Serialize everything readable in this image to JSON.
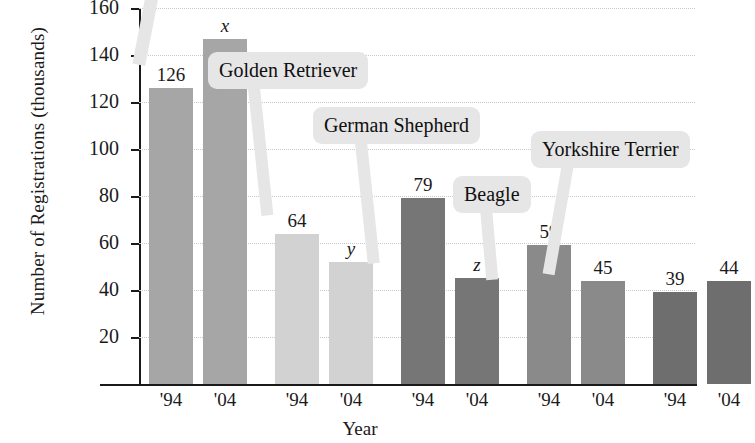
{
  "chart_data": {
    "type": "bar",
    "title": "",
    "xlabel": "Year",
    "ylabel": "Number of Registrations (thousands)",
    "ylim": [
      0,
      160
    ],
    "ytick_labels": [
      "20",
      "40",
      "60",
      "80",
      "100",
      "120",
      "140",
      "160"
    ],
    "ytick_values": [
      20,
      40,
      60,
      80,
      100,
      120,
      140,
      160
    ],
    "grid": true,
    "legend": "none",
    "categories": [
      "'94",
      "'04",
      "'94",
      "'04",
      "'94",
      "'04",
      "'94",
      "'04",
      "'94",
      "'04"
    ],
    "groups": [
      {
        "breed_label": "",
        "breed_label_visible": false,
        "color": "#a6a6a6",
        "bars": [
          {
            "year": "'94",
            "label": "126",
            "value": 126,
            "label_italic": false
          },
          {
            "year": "'04",
            "label": "x",
            "value": 147,
            "label_italic": true
          }
        ]
      },
      {
        "breed_label": "Golden Retriever",
        "breed_label_visible": true,
        "color": "#d2d2d2",
        "bars": [
          {
            "year": "'94",
            "label": "64",
            "value": 64,
            "label_italic": false
          },
          {
            "year": "'04",
            "label": "y",
            "value": 52,
            "label_italic": true
          }
        ]
      },
      {
        "breed_label": "German Shepherd",
        "breed_label_visible": true,
        "color": "#767676",
        "bars": [
          {
            "year": "'94",
            "label": "79",
            "value": 79,
            "label_italic": false
          },
          {
            "year": "'04",
            "label": "z",
            "value": 45,
            "label_italic": true
          }
        ]
      },
      {
        "breed_label": "Beagle",
        "breed_label_visible": true,
        "color": "#8a8a8a",
        "bars": [
          {
            "year": "'94",
            "label": "59",
            "value": 59,
            "label_italic": false
          },
          {
            "year": "'04",
            "label": "45",
            "value": 44,
            "label_italic": false
          }
        ]
      },
      {
        "breed_label": "Yorkshire Terrier",
        "breed_label_visible": true,
        "color": "#6e6e6e",
        "bars": [
          {
            "year": "'94",
            "label": "39",
            "value": 39,
            "label_italic": false
          },
          {
            "year": "'04",
            "label": "44",
            "value": 44,
            "label_italic": false
          }
        ]
      }
    ],
    "callouts": [
      {
        "text": "Golden Retriever",
        "x": 208,
        "y": 52
      },
      {
        "text": "German Shepherd",
        "x": 313,
        "y": 107
      },
      {
        "text": "Beagle",
        "x": 453,
        "y": 176
      },
      {
        "text": "Yorkshire Terrier",
        "x": 531,
        "y": 131
      }
    ],
    "annotations": [
      "Top-left breed callout box is cropped off the top edge of the image",
      "Bars labeled x, y and z are unknown quantities"
    ],
    "colors": {
      "axis": "#1a1a1a",
      "gridline": "#c9c9c9",
      "callout_background": "#e6e6e6",
      "page_background": "#ffffff"
    }
  }
}
